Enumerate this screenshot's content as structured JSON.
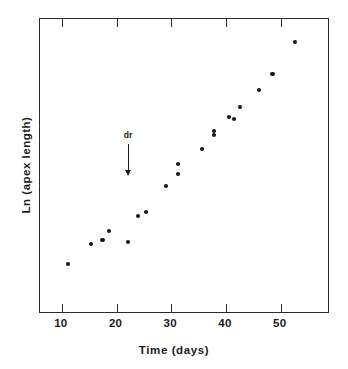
{
  "chart_data": {
    "type": "scatter",
    "title": "",
    "xlabel": "Time (days)",
    "ylabel": "Ln (apex length)",
    "xlim": [
      6,
      59
    ],
    "ylim": [
      0,
      1
    ],
    "grid": false,
    "legend": null,
    "xticks": [
      10,
      20,
      30,
      40,
      50
    ],
    "xtick_labels": [
      "10",
      "20",
      "30",
      "40",
      "50"
    ],
    "yticks": [],
    "ytick_labels": [],
    "x": [
      11.3,
      15.5,
      17.6,
      18.8,
      22.3,
      24.1,
      25.6,
      29.2,
      31.4,
      31.4,
      35.8,
      38.0,
      38.0,
      40.7,
      41.6,
      42.7,
      46.2,
      48.7,
      52.8
    ],
    "y": [
      0.166,
      0.234,
      0.247,
      0.278,
      0.241,
      0.329,
      0.342,
      0.43,
      0.471,
      0.505,
      0.556,
      0.603,
      0.617,
      0.664,
      0.658,
      0.698,
      0.756,
      0.81,
      0.919
    ],
    "series": [
      {
        "name": "apex length",
        "marker": "filled-circle",
        "color": "#141414",
        "points": [
          {
            "x": 11.3,
            "y": 0.166
          },
          {
            "x": 15.5,
            "y": 0.234
          },
          {
            "x": 17.6,
            "y": 0.247
          },
          {
            "x": 18.8,
            "y": 0.278
          },
          {
            "x": 22.3,
            "y": 0.241
          },
          {
            "x": 24.1,
            "y": 0.329
          },
          {
            "x": 25.6,
            "y": 0.342
          },
          {
            "x": 29.2,
            "y": 0.43
          },
          {
            "x": 31.4,
            "y": 0.471
          },
          {
            "x": 31.4,
            "y": 0.505
          },
          {
            "x": 35.8,
            "y": 0.556
          },
          {
            "x": 38.0,
            "y": 0.603
          },
          {
            "x": 38.0,
            "y": 0.617
          },
          {
            "x": 40.7,
            "y": 0.664
          },
          {
            "x": 41.6,
            "y": 0.658
          },
          {
            "x": 42.7,
            "y": 0.698
          },
          {
            "x": 46.2,
            "y": 0.756
          },
          {
            "x": 48.7,
            "y": 0.81
          },
          {
            "x": 52.8,
            "y": 0.919
          }
        ]
      }
    ],
    "annotations": [
      {
        "text": "dr",
        "x": 22.3,
        "y": 0.62,
        "arrow": "down"
      }
    ]
  }
}
